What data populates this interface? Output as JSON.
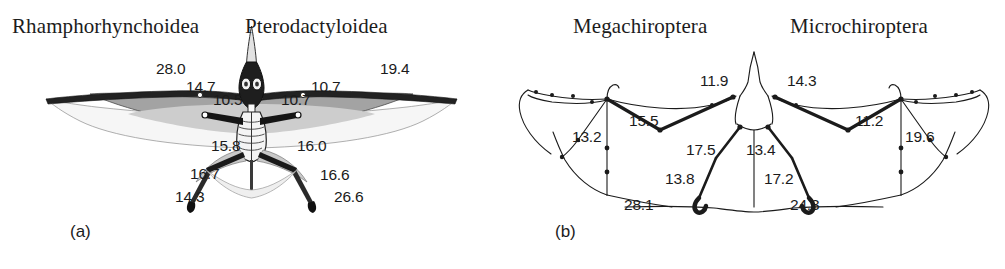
{
  "figure": {
    "type": "scientific-comparative-anatomy-diagram",
    "caption_labels": [
      {
        "id": "a",
        "text": "(a)",
        "x": 70,
        "y": 222
      },
      {
        "id": "b",
        "text": "(b)",
        "x": 555,
        "y": 222
      }
    ]
  },
  "panel_a": {
    "subject": "pterosaur-wing-skeleton",
    "titles": [
      {
        "name": "left-taxon-title",
        "text": "Rhamphorhynchoidea",
        "x": 12,
        "y": 14
      },
      {
        "name": "right-taxon-title",
        "text": "Pterodactyloidea",
        "x": 245,
        "y": 14
      }
    ],
    "measurements": [
      {
        "value": "28.0",
        "x": 156,
        "y": 60,
        "side": "left",
        "part": "wing-metacarpal-outer"
      },
      {
        "value": "14.7",
        "x": 186,
        "y": 78,
        "side": "left",
        "part": "wing-phalanx"
      },
      {
        "value": "10.5",
        "x": 213,
        "y": 91,
        "side": "left",
        "part": "humerus"
      },
      {
        "value": "10.7",
        "x": 281,
        "y": 91,
        "side": "right",
        "part": "humerus"
      },
      {
        "value": "10.7",
        "x": 311,
        "y": 78,
        "side": "right",
        "part": "wing-phalanx"
      },
      {
        "value": "19.4",
        "x": 380,
        "y": 60,
        "side": "right",
        "part": "wing-metacarpal-outer"
      },
      {
        "value": "15.8",
        "x": 211,
        "y": 137,
        "side": "left",
        "part": "femur-upper"
      },
      {
        "value": "16.0",
        "x": 297,
        "y": 137,
        "side": "right",
        "part": "femur-upper"
      },
      {
        "value": "16.7",
        "x": 190,
        "y": 165,
        "side": "left",
        "part": "femur"
      },
      {
        "value": "16.6",
        "x": 320,
        "y": 166,
        "side": "right",
        "part": "femur"
      },
      {
        "value": "14.3",
        "x": 175,
        "y": 188,
        "side": "left",
        "part": "tibia"
      },
      {
        "value": "26.6",
        "x": 334,
        "y": 188,
        "side": "right",
        "part": "tibia"
      }
    ]
  },
  "panel_b": {
    "subject": "bat-wing-skeleton",
    "titles": [
      {
        "name": "left-taxon-title",
        "text": "Megachiroptera",
        "x": 573,
        "y": 14
      },
      {
        "name": "right-taxon-title",
        "text": "Microchiroptera",
        "x": 790,
        "y": 14
      }
    ],
    "measurements": [
      {
        "value": "11.9",
        "x": 700,
        "y": 72,
        "side": "left",
        "part": "humerus"
      },
      {
        "value": "14.3",
        "x": 787,
        "y": 72,
        "side": "right",
        "part": "humerus"
      },
      {
        "value": "13.2",
        "x": 572,
        "y": 128,
        "side": "left",
        "part": "digit-outer"
      },
      {
        "value": "15.5",
        "x": 629,
        "y": 112,
        "side": "left",
        "part": "radius"
      },
      {
        "value": "11.2",
        "x": 855,
        "y": 112,
        "side": "right",
        "part": "radius"
      },
      {
        "value": "19.6",
        "x": 905,
        "y": 128,
        "side": "right",
        "part": "digit-outer"
      },
      {
        "value": "17.5",
        "x": 686,
        "y": 141,
        "side": "left",
        "part": "femur-upper"
      },
      {
        "value": "13.4",
        "x": 746,
        "y": 141,
        "side": "right",
        "part": "femur-upper"
      },
      {
        "value": "13.8",
        "x": 665,
        "y": 170,
        "side": "left",
        "part": "tibia"
      },
      {
        "value": "17.2",
        "x": 764,
        "y": 170,
        "side": "right",
        "part": "tibia"
      },
      {
        "value": "28.1",
        "x": 624,
        "y": 196,
        "side": "left",
        "part": "foot"
      },
      {
        "value": "24.3",
        "x": 790,
        "y": 196,
        "side": "right",
        "part": "foot"
      }
    ]
  },
  "colors": {
    "ink": "#1b1b1b",
    "membrane_gray": "#9a9a9a",
    "membrane_light": "#c8c8c8",
    "membrane_pale": "#ebebeb",
    "background": "#ffffff"
  }
}
